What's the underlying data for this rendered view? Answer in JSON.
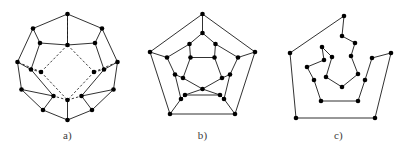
{
  "figure": {
    "background_color": "#ffffff",
    "ink_color": "#1a1a1a",
    "vertex_color": "#000000",
    "width": 407,
    "height": 156
  },
  "panels": [
    {
      "id": "a",
      "caption": "a)",
      "description": "Three-dimensional perspective drawing of the regular dodecahedron graph with hidden edges shown dashed",
      "vertex_count": 20,
      "vertex_radius": 2.3,
      "viewbox": "0 0 135 156",
      "vertices": [
        {
          "name": "outer-1",
          "x": 67.5,
          "y": 14.0
        },
        {
          "name": "outer-2",
          "x": 33.0,
          "y": 28.5
        },
        {
          "name": "outer-3",
          "x": 102.0,
          "y": 28.5
        },
        {
          "name": "outer-4",
          "x": 17.5,
          "y": 62.0
        },
        {
          "name": "outer-5",
          "x": 117.5,
          "y": 62.0
        },
        {
          "name": "outer-6",
          "x": 21.5,
          "y": 89.5
        },
        {
          "name": "outer-7",
          "x": 113.5,
          "y": 89.5
        },
        {
          "name": "outer-8",
          "x": 43.0,
          "y": 110.0
        },
        {
          "name": "outer-9",
          "x": 92.0,
          "y": 110.0
        },
        {
          "name": "outer-10",
          "x": 67.5,
          "y": 120.0
        },
        {
          "name": "mid-1",
          "x": 67.5,
          "y": 45.0
        },
        {
          "name": "mid-2",
          "x": 40.0,
          "y": 43.0
        },
        {
          "name": "mid-3",
          "x": 95.0,
          "y": 43.0
        },
        {
          "name": "mid-4",
          "x": 31.0,
          "y": 69.5
        },
        {
          "name": "mid-5",
          "x": 104.0,
          "y": 69.5
        },
        {
          "name": "mid-6",
          "x": 53.5,
          "y": 96.0
        },
        {
          "name": "mid-7",
          "x": 81.5,
          "y": 96.0
        },
        {
          "name": "inner-1",
          "x": 67.5,
          "y": 100.0
        },
        {
          "name": "inner-2",
          "x": 41.0,
          "y": 72.0
        },
        {
          "name": "inner-3",
          "x": 94.0,
          "y": 72.0
        }
      ],
      "solid_edges": [
        [
          67.5,
          14.0,
          33.0,
          28.5
        ],
        [
          67.5,
          14.0,
          102.0,
          28.5
        ],
        [
          33.0,
          28.5,
          17.5,
          62.0
        ],
        [
          102.0,
          28.5,
          117.5,
          62.0
        ],
        [
          17.5,
          62.0,
          21.5,
          89.5
        ],
        [
          117.5,
          62.0,
          113.5,
          89.5
        ],
        [
          21.5,
          89.5,
          43.0,
          110.0
        ],
        [
          113.5,
          89.5,
          92.0,
          110.0
        ],
        [
          43.0,
          110.0,
          67.5,
          120.0
        ],
        [
          92.0,
          110.0,
          67.5,
          120.0
        ],
        [
          33.0,
          28.5,
          40.0,
          43.0
        ],
        [
          102.0,
          28.5,
          95.0,
          43.0
        ],
        [
          40.0,
          43.0,
          67.5,
          45.0
        ],
        [
          95.0,
          43.0,
          67.5,
          45.0
        ],
        [
          17.5,
          62.0,
          31.0,
          69.5
        ],
        [
          117.5,
          62.0,
          104.0,
          69.5
        ],
        [
          21.5,
          89.5,
          53.5,
          96.0
        ],
        [
          113.5,
          89.5,
          81.5,
          96.0
        ],
        [
          40.0,
          43.0,
          31.0,
          69.5
        ],
        [
          95.0,
          43.0,
          104.0,
          69.5
        ],
        [
          31.0,
          69.5,
          53.5,
          96.0
        ],
        [
          104.0,
          69.5,
          81.5,
          96.0
        ],
        [
          43.0,
          110.0,
          53.5,
          96.0
        ],
        [
          92.0,
          110.0,
          81.5,
          96.0
        ],
        [
          67.5,
          45.0,
          67.5,
          14.0
        ],
        [
          67.5,
          120.0,
          67.5,
          100.0
        ]
      ],
      "dashed_edges": [
        [
          67.5,
          45.0,
          41.0,
          72.0
        ],
        [
          67.5,
          45.0,
          94.0,
          72.0
        ],
        [
          41.0,
          72.0,
          67.5,
          100.0
        ],
        [
          94.0,
          72.0,
          67.5,
          100.0
        ],
        [
          41.0,
          72.0,
          31.0,
          69.5
        ],
        [
          94.0,
          72.0,
          104.0,
          69.5
        ],
        [
          41.0,
          72.0,
          17.5,
          62.0
        ],
        [
          94.0,
          72.0,
          117.5,
          62.0
        ],
        [
          67.5,
          100.0,
          53.5,
          96.0
        ],
        [
          67.5,
          100.0,
          81.5,
          96.0
        ],
        [
          67.5,
          14.0,
          67.5,
          45.0
        ]
      ]
    },
    {
      "id": "b",
      "caption": "b)",
      "description": "Planar Schlegel diagram of the dodecahedron graph, all edges solid",
      "vertex_count": 20,
      "vertex_radius": 2.3,
      "viewbox": "0 0 135 156",
      "vertices": [
        {
          "name": "outer-top",
          "x": 67.5,
          "y": 14.0
        },
        {
          "name": "outer-left",
          "x": 15.0,
          "y": 52.0
        },
        {
          "name": "outer-right",
          "x": 120.0,
          "y": 52.0
        },
        {
          "name": "outer-bottom-left",
          "x": 35.0,
          "y": 114.0
        },
        {
          "name": "outer-bottom-right",
          "x": 100.0,
          "y": 114.0
        },
        {
          "name": "spoke-top",
          "x": 67.5,
          "y": 33.0
        },
        {
          "name": "spoke-left",
          "x": 32.0,
          "y": 57.5
        },
        {
          "name": "spoke-right",
          "x": 103.0,
          "y": 57.5
        },
        {
          "name": "spoke-bottom-left",
          "x": 46.0,
          "y": 99.0
        },
        {
          "name": "spoke-bottom-right",
          "x": 89.0,
          "y": 99.0
        },
        {
          "name": "ring-1",
          "x": 54.5,
          "y": 44.0
        },
        {
          "name": "ring-2",
          "x": 80.5,
          "y": 44.0
        },
        {
          "name": "ring-3",
          "x": 95.0,
          "y": 74.5
        },
        {
          "name": "ring-4",
          "x": 85.0,
          "y": 95.0
        },
        {
          "name": "ring-5",
          "x": 50.0,
          "y": 95.0
        },
        {
          "name": "ring-6",
          "x": 40.0,
          "y": 74.5
        },
        {
          "name": "inner-top-left",
          "x": 55.5,
          "y": 57.5
        },
        {
          "name": "inner-top-right",
          "x": 79.5,
          "y": 57.5
        },
        {
          "name": "inner-right",
          "x": 87.0,
          "y": 78.0
        },
        {
          "name": "inner-left",
          "x": 48.0,
          "y": 78.0
        },
        {
          "name": "inner-bottom",
          "x": 67.5,
          "y": 89.0
        }
      ],
      "solid_edges": [
        [
          67.5,
          14.0,
          15.0,
          52.0
        ],
        [
          67.5,
          14.0,
          120.0,
          52.0
        ],
        [
          15.0,
          52.0,
          35.0,
          114.0
        ],
        [
          120.0,
          52.0,
          100.0,
          114.0
        ],
        [
          35.0,
          114.0,
          100.0,
          114.0
        ],
        [
          67.5,
          14.0,
          67.5,
          33.0
        ],
        [
          15.0,
          52.0,
          32.0,
          57.5
        ],
        [
          120.0,
          52.0,
          103.0,
          57.5
        ],
        [
          35.0,
          114.0,
          46.0,
          99.0
        ],
        [
          100.0,
          114.0,
          89.0,
          99.0
        ],
        [
          67.5,
          33.0,
          54.5,
          44.0
        ],
        [
          67.5,
          33.0,
          80.5,
          44.0
        ],
        [
          103.0,
          57.5,
          80.5,
          44.0
        ],
        [
          103.0,
          57.5,
          95.0,
          74.5
        ],
        [
          89.0,
          99.0,
          95.0,
          74.5
        ],
        [
          89.0,
          99.0,
          85.0,
          95.0
        ],
        [
          46.0,
          99.0,
          50.0,
          95.0
        ],
        [
          46.0,
          99.0,
          40.0,
          74.5
        ],
        [
          32.0,
          57.5,
          40.0,
          74.5
        ],
        [
          32.0,
          57.5,
          54.5,
          44.0
        ],
        [
          54.5,
          44.0,
          55.5,
          57.5
        ],
        [
          80.5,
          44.0,
          79.5,
          57.5
        ],
        [
          95.0,
          74.5,
          87.0,
          78.0
        ],
        [
          85.0,
          95.0,
          67.5,
          89.0
        ],
        [
          50.0,
          95.0,
          67.5,
          89.0
        ],
        [
          40.0,
          74.5,
          48.0,
          78.0
        ],
        [
          85.0,
          95.0,
          50.0,
          95.0
        ],
        [
          55.5,
          57.5,
          79.5,
          57.5
        ],
        [
          79.5,
          57.5,
          87.0,
          78.0
        ],
        [
          87.0,
          78.0,
          67.5,
          89.0
        ],
        [
          67.5,
          89.0,
          48.0,
          78.0
        ],
        [
          48.0,
          78.0,
          55.5,
          57.5
        ]
      ],
      "dashed_edges": []
    },
    {
      "id": "c",
      "caption": "c)",
      "description": "Hamiltonian cycle traced through all twenty vertices of the dodecahedron graph",
      "vertex_count": 20,
      "vertex_radius": 2.3,
      "viewbox": "0 0 137 156",
      "cycle": [
        {
          "name": "h1",
          "x": 74.0,
          "y": 16.0
        },
        {
          "name": "h2",
          "x": 20.0,
          "y": 53.0
        },
        {
          "name": "h3",
          "x": 26.0,
          "y": 118.0
        },
        {
          "name": "h4",
          "x": 105.0,
          "y": 118.0
        },
        {
          "name": "h5",
          "x": 121.0,
          "y": 53.0
        },
        {
          "name": "h6",
          "x": 102.0,
          "y": 58.0
        },
        {
          "name": "h7",
          "x": 95.0,
          "y": 80.0
        },
        {
          "name": "h8",
          "x": 88.0,
          "y": 101.0
        },
        {
          "name": "h9",
          "x": 51.0,
          "y": 101.0
        },
        {
          "name": "h10",
          "x": 44.0,
          "y": 80.0
        },
        {
          "name": "h11",
          "x": 37.0,
          "y": 67.0
        },
        {
          "name": "h12",
          "x": 54.0,
          "y": 60.0
        },
        {
          "name": "h13",
          "x": 52.0,
          "y": 47.0
        },
        {
          "name": "h14",
          "x": 62.0,
          "y": 57.0
        },
        {
          "name": "h15",
          "x": 56.0,
          "y": 77.0
        },
        {
          "name": "h16",
          "x": 72.0,
          "y": 87.0
        },
        {
          "name": "h17",
          "x": 88.0,
          "y": 74.0
        },
        {
          "name": "h18",
          "x": 81.0,
          "y": 56.0
        },
        {
          "name": "h19",
          "x": 85.0,
          "y": 43.0
        },
        {
          "name": "h20",
          "x": 72.0,
          "y": 36.0
        }
      ],
      "closed": true
    }
  ]
}
